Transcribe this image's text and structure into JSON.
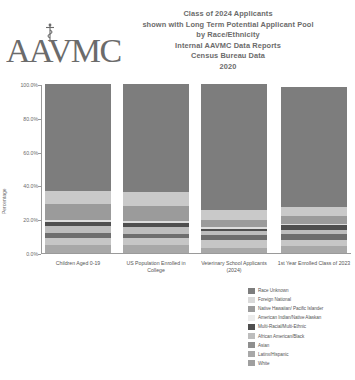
{
  "header": {
    "logo_text": "AAVMC",
    "logo_name": "aavmc-logo",
    "title_lines": [
      "Class of 2024 Applicants",
      "shown with Long Term Potential Applicant Pool",
      "by Race/Ethnicity",
      "Internal AAVMC Data Reports",
      "Census Bureau Data",
      "2020"
    ]
  },
  "chart_data": {
    "type": "bar",
    "subtype": "stacked-percentage",
    "title": "Class of 2024 Applicants shown with Long Term Potential Applicant Pool by Race/Ethnicity",
    "xlabel": "",
    "ylabel": "Percentage",
    "ylim": [
      0,
      100
    ],
    "yticks": [
      "0.0%",
      "20.0%",
      "40.0%",
      "60.0%",
      "80.0%",
      "100.0%"
    ],
    "ytick_values": [
      0,
      20,
      40,
      60,
      80,
      100
    ],
    "grid": false,
    "legend_position": "bottom-right",
    "categories": [
      "Children Aged 0-19",
      "US Population Enrolled in College",
      "Veterinary School Applicants (2024)",
      "1st Year Enrolled Class of 2023"
    ],
    "series": [
      {
        "name": "White",
        "color": "#a8a8a8",
        "values": [
          4.5,
          5.0,
          3.0,
          4.0
        ]
      },
      {
        "name": "Latinx/Hispanic",
        "color": "#c6c6c6",
        "values": [
          4.5,
          3.8,
          4.5,
          4.0
        ]
      },
      {
        "name": "Asian",
        "color": "#6e6e6e",
        "values": [
          3.0,
          2.4,
          3.0,
          3.0
        ]
      },
      {
        "name": "African American/Black",
        "color": "#bdbdbd",
        "values": [
          4.0,
          4.2,
          2.5,
          2.5
        ]
      },
      {
        "name": "Multi-Racial/Multi-Ethnic",
        "color": "#4f4f4f",
        "values": [
          2.5,
          2.4,
          1.5,
          3.0
        ]
      },
      {
        "name": "American Indian/Native Alaskan",
        "color": "#dedede",
        "values": [
          1.0,
          1.0,
          0.8,
          0.8
        ]
      },
      {
        "name": "Native Hawaiian/ Pacific Islander",
        "color": "#9b9b9b",
        "values": [
          9.5,
          9.0,
          4.0,
          4.5
        ]
      },
      {
        "name": "Foreign National",
        "color": "#c9c9c9",
        "values": [
          8.0,
          8.5,
          6.0,
          5.5
        ]
      },
      {
        "name": "Race Unknown",
        "color": "#7d7d7d",
        "values": [
          63.0,
          63.7,
          74.7,
          70.7
        ]
      }
    ],
    "stack_order_bottom_to_top": [
      "White",
      "Latinx/Hispanic",
      "Asian",
      "African American/Black",
      "Multi-Racial/Multi-Ethnic",
      "American Indian/Native Alaskan",
      "Native Hawaiian/ Pacific Islander",
      "Foreign National",
      "Race Unknown"
    ]
  },
  "legend": {
    "items": [
      {
        "label": "Race Unknown",
        "color": "#7d7d7d"
      },
      {
        "label": "Foreign National",
        "color": "#dadada"
      },
      {
        "label": "Native Hawaiian/ Pacific Islander",
        "color": "#9b9b9b"
      },
      {
        "label": "American Indian/Native Alaskan",
        "color": "#ececec"
      },
      {
        "label": "Multi-Racial/Multi-Ethnic",
        "color": "#4f4f4f"
      },
      {
        "label": "African American/Black",
        "color": "#bdbdbd"
      },
      {
        "label": "Asian",
        "color": "#8f8f8f"
      },
      {
        "label": "Latinx/Hispanic",
        "color": "#a8a8a8"
      },
      {
        "label": "White",
        "color": "#9f9f9f"
      }
    ]
  }
}
